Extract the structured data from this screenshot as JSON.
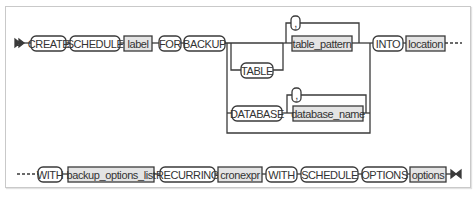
{
  "diagram": {
    "type": "railroad-syntax-diagram",
    "colors": {
      "line": "#3a3a3a",
      "keyword_fill": "#ffffff",
      "parameter_fill": "#e4e4e4",
      "frame_border": "#c9c9c9"
    },
    "row1": {
      "create": "CREATE",
      "schedule": "SCHEDULE",
      "label": "label",
      "for": "FOR",
      "backup": "BACKUP",
      "table_branch": {
        "table": "TABLE",
        "comma": ",",
        "table_pattern": "table_pattern"
      },
      "database_branch": {
        "database": "DATABASE",
        "comma": ",",
        "database_name": "database_name"
      },
      "into": "INTO",
      "location": "location"
    },
    "row2": {
      "with": "WITH",
      "backup_options_list": "backup_options_list",
      "recurring": "RECURRING",
      "cronexpr": "cronexpr",
      "with2": "WITH",
      "schedule": "SCHEDULE",
      "options_kw": "OPTIONS",
      "options": "options"
    }
  }
}
